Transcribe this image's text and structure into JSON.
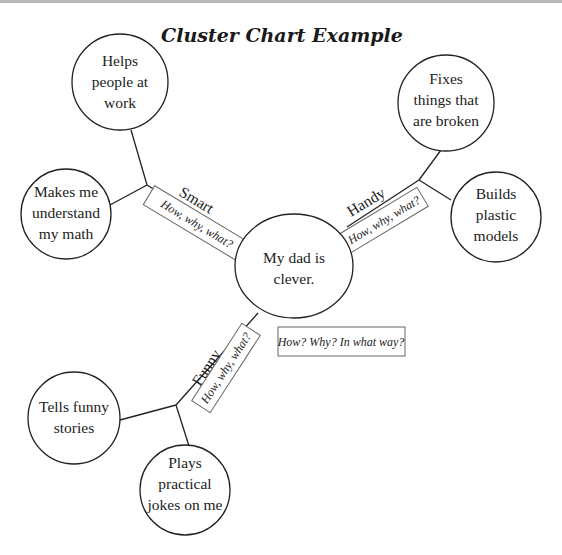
{
  "title": "Cluster Chart Example",
  "center": {
    "lines": [
      "My dad is",
      "clever."
    ]
  },
  "branches": [
    {
      "label": "Smart",
      "prompt": "How, why, what?",
      "details": [
        {
          "lines": [
            "Helps",
            "people at",
            "work"
          ]
        },
        {
          "lines": [
            "Makes me",
            "understand",
            "my math"
          ]
        }
      ]
    },
    {
      "label": "Handy",
      "prompt": "How, why, what?",
      "details": [
        {
          "lines": [
            "Fixes",
            "things that",
            "are broken"
          ]
        },
        {
          "lines": [
            "Builds",
            "plastic",
            "models"
          ]
        }
      ]
    },
    {
      "label": "Funny",
      "prompt": "How, why, what?",
      "details": [
        {
          "lines": [
            "Tells funny",
            "stories"
          ]
        },
        {
          "lines": [
            "Plays",
            "practical",
            "jokes on me"
          ]
        }
      ]
    }
  ],
  "center_prompt": "How? Why? In what way?",
  "colors": {
    "stroke": "#222222",
    "box_stroke": "#666666",
    "background": "#ffffff",
    "top_bar": "#b8b8b8"
  }
}
